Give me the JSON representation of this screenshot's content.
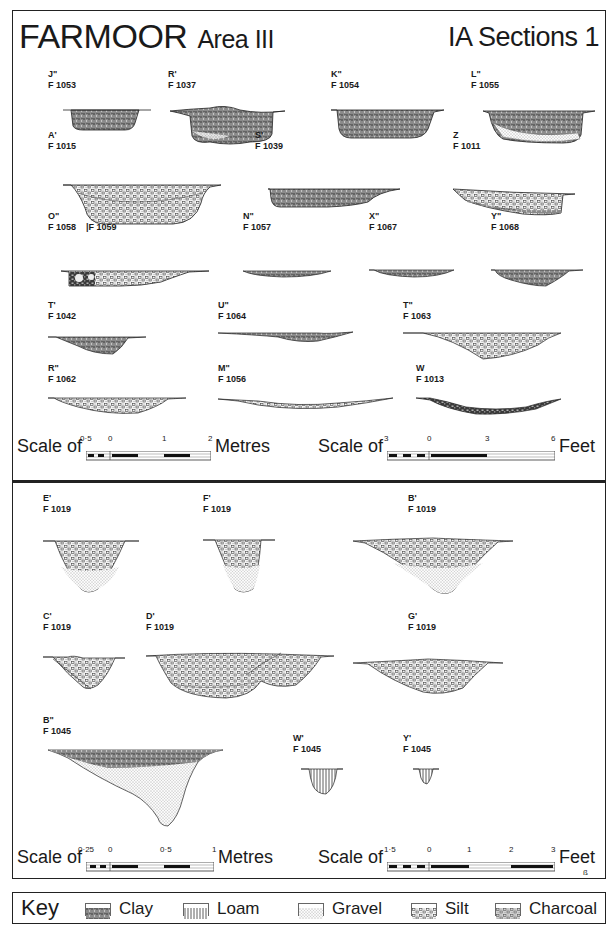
{
  "header": {
    "site": "FARMOOR",
    "area": "Area III",
    "sheet": "IA Sections 1"
  },
  "top_panel": {
    "sections": [
      {
        "letter": "J\"",
        "feature": "F 1053",
        "fill": "clay"
      },
      {
        "letter": "R'",
        "feature": "F 1037",
        "fill": "clay-silt"
      },
      {
        "letter": "K\"",
        "feature": "F 1054",
        "fill": "clay"
      },
      {
        "letter": "L\"",
        "feature": "F 1055",
        "fill": "clay-silt"
      },
      {
        "letter": "A'",
        "feature": "F 1015",
        "fill": "gravel"
      },
      {
        "letter": "S'",
        "feature": "F 1039",
        "fill": "clay"
      },
      {
        "letter": "Z",
        "feature": "F 1011",
        "fill": "gravel"
      },
      {
        "letter": "O\"",
        "feature": "F 1058",
        "feature2": "|F 1059",
        "fill": "charcoal-gravel"
      },
      {
        "letter": "N\"",
        "feature": "F 1057",
        "fill": "clay"
      },
      {
        "letter": "X\"",
        "feature": "F 1067",
        "fill": "clay"
      },
      {
        "letter": "Y\"",
        "feature": "F 1068",
        "fill": "clay"
      },
      {
        "letter": "T'",
        "feature": "F 1042",
        "fill": "clay"
      },
      {
        "letter": "U\"",
        "feature": "F 1064",
        "fill": "clay"
      },
      {
        "letter": "T\"",
        "feature": "F 1063",
        "fill": "gravel"
      },
      {
        "letter": "R\"",
        "feature": "F 1062",
        "fill": "gravel"
      },
      {
        "letter": "M\"",
        "feature": "F 1056",
        "fill": "gravel"
      },
      {
        "letter": "W",
        "feature": "F 1013",
        "fill": "charcoal"
      }
    ],
    "scale_metres": {
      "prefix": "Scale of",
      "ticks": [
        "0·5",
        "0",
        "1",
        "2"
      ],
      "unit": "Metres"
    },
    "scale_feet": {
      "prefix": "Scale of",
      "ticks": [
        "3",
        "0",
        "3",
        "6"
      ],
      "unit": "Feet"
    }
  },
  "bottom_panel": {
    "sections": [
      {
        "letter": "E'",
        "feature": "F 1019",
        "fill": "gravel-silt"
      },
      {
        "letter": "F'",
        "feature": "F 1019",
        "fill": "gravel-silt"
      },
      {
        "letter": "B'",
        "feature": "F 1019",
        "fill": "gravel-silt"
      },
      {
        "letter": "C'",
        "feature": "F 1019",
        "fill": "gravel-silt"
      },
      {
        "letter": "D'",
        "feature": "F 1019",
        "fill": "gravel-silt"
      },
      {
        "letter": "G'",
        "feature": "F 1019",
        "fill": "gravel-silt"
      },
      {
        "letter": "B\"",
        "feature": "F 1045",
        "fill": "clay-silt"
      },
      {
        "letter": "W'",
        "feature": "F 1045",
        "fill": "loam"
      },
      {
        "letter": "Y'",
        "feature": "F 1045",
        "fill": "loam"
      }
    ],
    "scale_metres": {
      "prefix": "Scale of",
      "ticks": [
        "0·25",
        "0",
        "0·5",
        "1"
      ],
      "unit": "Metres"
    },
    "scale_feet": {
      "prefix": "Scale of",
      "ticks": [
        "1·5",
        "0",
        "1",
        "2",
        "3"
      ],
      "unit": "Feet"
    },
    "signature": "ß"
  },
  "key": {
    "title": "Key",
    "items": [
      {
        "label": "Clay",
        "pattern": "clay"
      },
      {
        "label": "Loam",
        "pattern": "loam"
      },
      {
        "label": "Gravel",
        "pattern": "gravel"
      },
      {
        "label": "Silt",
        "pattern": "silt"
      },
      {
        "label": "Charcoal",
        "pattern": "charcoal"
      }
    ]
  },
  "colors": {
    "ink": "#1a1a1a",
    "paper": "#ffffff",
    "clay": "#6e6e6e",
    "gravel": "#b5b5b5",
    "silt": "#d6d6d6"
  }
}
